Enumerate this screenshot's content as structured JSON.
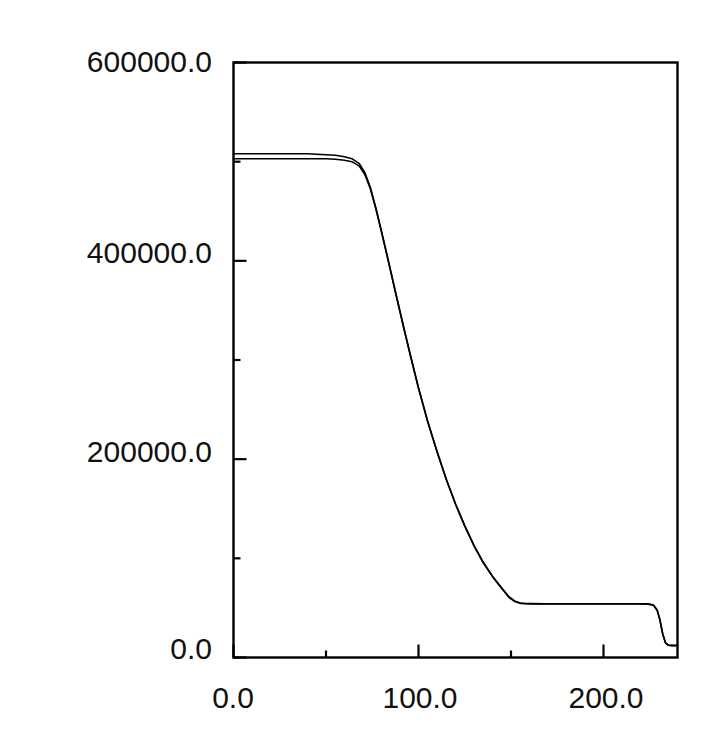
{
  "chart_data": {
    "type": "line",
    "title": "",
    "xlabel": "",
    "ylabel": "",
    "xlim": [
      0.0,
      240.0
    ],
    "ylim": [
      0.0,
      600000.0
    ],
    "grid": false,
    "legend": null,
    "x_ticks": [
      {
        "value": 0.0,
        "label": "0.0",
        "major": true
      },
      {
        "value": 50.0,
        "label": "",
        "major": false
      },
      {
        "value": 100.0,
        "label": "100.0",
        "major": true
      },
      {
        "value": 150.0,
        "label": "",
        "major": false
      },
      {
        "value": 200.0,
        "label": "200.0",
        "major": true
      }
    ],
    "y_ticks": [
      {
        "value": 0.0,
        "label": "0.0",
        "major": true
      },
      {
        "value": 100000.0,
        "label": "",
        "major": false
      },
      {
        "value": 200000.0,
        "label": "200000.0",
        "major": true
      },
      {
        "value": 300000.0,
        "label": "",
        "major": false
      },
      {
        "value": 400000.0,
        "label": "400000.0",
        "major": true
      },
      {
        "value": 500000.0,
        "label": "",
        "major": false
      },
      {
        "value": 600000.0,
        "label": "600000.0",
        "major": true
      }
    ],
    "x_tick_labels": [
      "0.0",
      "100.0",
      "200.0"
    ],
    "y_tick_labels": [
      "0.0",
      "200000.0",
      "400000.0",
      "600000.0"
    ],
    "line_color": "#000000",
    "line_width": 1.6,
    "series": [
      {
        "name": "series-1",
        "x": [
          0,
          5,
          10,
          15,
          20,
          25,
          30,
          35,
          40,
          45,
          50,
          55,
          60,
          64,
          68,
          71,
          74,
          77,
          80,
          84,
          88,
          92,
          96,
          100,
          105,
          110,
          115,
          120,
          125,
          130,
          135,
          140,
          145,
          149,
          152,
          155,
          158,
          162,
          168,
          175,
          182,
          190,
          198,
          206,
          214,
          220,
          224,
          227,
          229,
          230.5,
          232,
          233.5,
          235,
          237,
          240
        ],
        "y": [
          508000,
          508000,
          508000,
          508000,
          508000,
          508000,
          508000,
          508000,
          508000,
          507500,
          507000,
          506500,
          505000,
          503000,
          498000,
          489000,
          474000,
          453000,
          430000,
          398000,
          365000,
          333000,
          302000,
          272000,
          238000,
          208000,
          180000,
          155000,
          133000,
          113000,
          96000,
          82000,
          70000,
          61000,
          57000,
          55000,
          54500,
          54300,
          54200,
          54200,
          54200,
          54200,
          54200,
          54200,
          54200,
          54200,
          54100,
          53000,
          48000,
          38000,
          24000,
          15000,
          12500,
          12200,
          12200
        ]
      },
      {
        "name": "series-2",
        "x": [
          0,
          5,
          10,
          15,
          20,
          25,
          30,
          35,
          40,
          45,
          50,
          55,
          60,
          64,
          68,
          71,
          74,
          77,
          80,
          84,
          88,
          92,
          96,
          100,
          105,
          110,
          115,
          120,
          125,
          130,
          135,
          140,
          145,
          149,
          152,
          155,
          158,
          162,
          168,
          175,
          182,
          190,
          198,
          206,
          214,
          220,
          224,
          227,
          229,
          230.5,
          232,
          233.5,
          235,
          237,
          240
        ],
        "y": [
          503000,
          503000,
          503000,
          503000,
          503000,
          503000,
          503000,
          503000,
          503000,
          503000,
          503000,
          502500,
          501500,
          500000,
          495500,
          487000,
          472500,
          452000,
          429000,
          397000,
          364500,
          332500,
          301500,
          271500,
          237500,
          207500,
          179500,
          154500,
          132500,
          112500,
          95500,
          81500,
          69500,
          60500,
          56500,
          54600,
          54200,
          54000,
          53900,
          53900,
          53900,
          53900,
          53900,
          53900,
          53900,
          53900,
          53800,
          52700,
          47700,
          37700,
          23700,
          14700,
          12300,
          12000,
          12000
        ]
      }
    ]
  },
  "axes": {
    "frame_color": "#000000",
    "background": "#ffffff"
  }
}
